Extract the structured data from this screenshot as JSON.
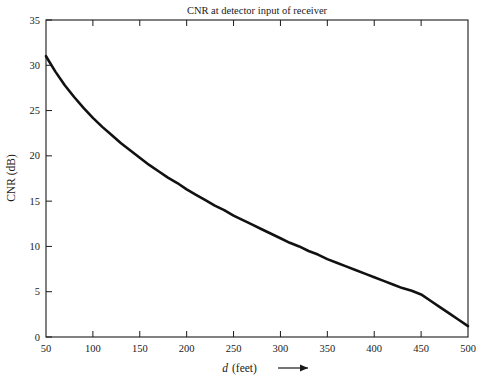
{
  "chart_data": {
    "type": "line",
    "title": "CNR at detector input of receiver",
    "xlabel": "d (feet)",
    "xlabel_italic_part": "d",
    "xlabel_rest": "(feet)",
    "ylabel": "CNR (dB)",
    "xlim": [
      50,
      500
    ],
    "ylim": [
      0,
      35
    ],
    "xticks": [
      50,
      100,
      150,
      200,
      250,
      300,
      350,
      400,
      450,
      500
    ],
    "xtick_labels": [
      "50",
      "100",
      "150",
      "200",
      "250",
      "300",
      "350",
      "400",
      "450",
      "500"
    ],
    "yticks": [
      0,
      5,
      10,
      15,
      20,
      25,
      30,
      35
    ],
    "ytick_labels": [
      "0",
      "5",
      "10",
      "15",
      "20",
      "25",
      "30",
      "35"
    ],
    "grid": false,
    "legend": null,
    "series": [
      {
        "name": "CNR",
        "color": "#111111",
        "x": [
          50,
          60,
          70,
          80,
          90,
          100,
          110,
          120,
          130,
          140,
          150,
          160,
          170,
          180,
          190,
          200,
          210,
          220,
          230,
          240,
          250,
          260,
          270,
          280,
          290,
          300,
          310,
          320,
          330,
          340,
          350,
          360,
          370,
          380,
          390,
          400,
          410,
          420,
          430,
          440,
          450,
          460,
          470,
          480,
          490,
          500
        ],
        "y": [
          31.0,
          29.3,
          27.8,
          26.5,
          25.3,
          24.2,
          23.2,
          22.3,
          21.4,
          20.6,
          19.8,
          19.0,
          18.3,
          17.6,
          17.0,
          16.3,
          15.7,
          15.1,
          14.5,
          14.0,
          13.4,
          12.9,
          12.4,
          11.9,
          11.4,
          10.9,
          10.4,
          10.0,
          9.5,
          9.1,
          8.6,
          8.2,
          7.8,
          7.4,
          7.0,
          6.6,
          6.2,
          5.8,
          5.4,
          5.1,
          4.7,
          4.0,
          3.3,
          2.6,
          1.9,
          1.2
        ]
      }
    ],
    "annotations": {
      "x_axis_arrow": "right-arrow"
    }
  }
}
